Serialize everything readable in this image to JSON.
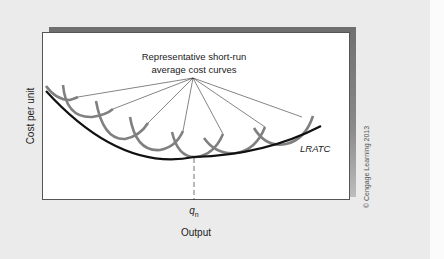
{
  "diagram": {
    "annotation": {
      "line1": "Representative short-run",
      "line2": "average cost curves"
    },
    "y_axis_label": "Cost per unit",
    "x_axis_label": "Output",
    "curve_label": "LRATC",
    "x_tick": {
      "symbol": "q",
      "subscript": "n"
    },
    "copyright": "© Cengage Learning 2013",
    "colors": {
      "background": "#ebebeb",
      "plot_background": "#ffffff",
      "shadow": "#6f6f6f",
      "lratc_curve": "#111111",
      "srac_curves": "#808080",
      "leader_lines": "#333333"
    },
    "srac_curve_count": 8
  }
}
